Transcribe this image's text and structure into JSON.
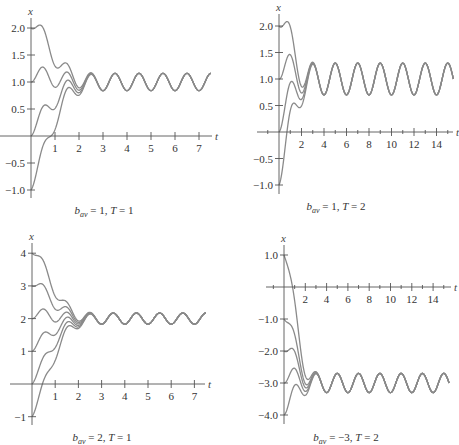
{
  "chart_data": [
    {
      "type": "line",
      "id": "p1",
      "caption": {
        "var": "b",
        "sub": "av",
        "rest": " = 1, ",
        "T": "T",
        "tail": " = 1"
      },
      "xlabel": "t",
      "ylabel": "x",
      "xlim": [
        0,
        7.5
      ],
      "ylim": [
        -1.0,
        2.0
      ],
      "xticks": [
        1,
        2,
        3,
        4,
        5,
        6,
        7
      ],
      "xtick_labels": [
        "1",
        "2",
        "3",
        "4",
        "5",
        "6",
        "7"
      ],
      "yticks": [
        2.0,
        1.5,
        1.0,
        0.5,
        -0.5,
        -1.0
      ],
      "ytick_labels": [
        "2.0",
        "1.5",
        "1.0",
        "0.5",
        "−0.5",
        "−1.0"
      ],
      "b_av": 1,
      "T": 1,
      "steady_center": 1.0,
      "steady_amplitude": 0.16,
      "initial_values": [
        2.0,
        1.0,
        0.0,
        -1.0
      ],
      "series": [
        {
          "name": "x(0)=2.0"
        },
        {
          "name": "x(0)=1.0"
        },
        {
          "name": "x(0)=0.0"
        },
        {
          "name": "x(0)=-1.0"
        }
      ]
    },
    {
      "type": "line",
      "id": "p2",
      "caption": {
        "var": "b",
        "sub": "av",
        "rest": " = 1, ",
        "T": "T",
        "tail": " = 2"
      },
      "xlabel": "t",
      "ylabel": "x",
      "xlim": [
        -1.5,
        15.5
      ],
      "ylim": [
        -1.0,
        2.0
      ],
      "xticks": [
        2,
        4,
        6,
        8,
        10,
        12,
        14
      ],
      "xtick_labels": [
        "2",
        "4",
        "6",
        "8",
        "10",
        "12",
        "14"
      ],
      "minor_xticks": [
        -1,
        1,
        3,
        5,
        7,
        9,
        11,
        13,
        15
      ],
      "yticks": [
        2.0,
        1.5,
        1.0,
        0.5,
        -0.5,
        -1.0
      ],
      "ytick_labels": [
        "2.0",
        "1.5",
        "1.0",
        "0.5",
        "−0.5",
        "−1.0"
      ],
      "b_av": 1,
      "T": 2,
      "steady_center": 1.0,
      "steady_amplitude": 0.3,
      "initial_values": [
        2.0,
        1.0,
        0.0,
        -1.0
      ],
      "series": [
        {
          "name": "x(0)=2.0"
        },
        {
          "name": "x(0)=1.0"
        },
        {
          "name": "x(0)=0.0"
        },
        {
          "name": "x(0)=-1.0"
        }
      ]
    },
    {
      "type": "line",
      "id": "p3",
      "caption": {
        "var": "b",
        "sub": "av",
        "rest": " = 2, ",
        "T": "T",
        "tail": " = 1"
      },
      "xlabel": "t",
      "ylabel": "x",
      "xlim": [
        -1.0,
        7.5
      ],
      "ylim": [
        -1.0,
        4.0
      ],
      "xticks": [
        1,
        2,
        3,
        4,
        5,
        6,
        7
      ],
      "xtick_labels": [
        "1",
        "2",
        "3",
        "4",
        "5",
        "6",
        "7"
      ],
      "yticks": [
        4,
        3,
        2,
        1,
        -1
      ],
      "ytick_labels": [
        "4",
        "3",
        "2",
        "1",
        "−1"
      ],
      "b_av": 2,
      "T": 1,
      "steady_center": 2.0,
      "steady_amplitude": 0.17,
      "initial_values": [
        4.0,
        3.0,
        2.0,
        1.0,
        0.0,
        -1.0
      ],
      "series": [
        {
          "name": "x(0)=4"
        },
        {
          "name": "x(0)=3"
        },
        {
          "name": "x(0)=2"
        },
        {
          "name": "x(0)=1"
        },
        {
          "name": "x(0)=0"
        },
        {
          "name": "x(0)=-1"
        }
      ]
    },
    {
      "type": "line",
      "id": "p4",
      "caption": {
        "var": "b",
        "sub": "av",
        "rest": " = −3, ",
        "T": "T",
        "tail": " = 2"
      },
      "xlabel": "t",
      "ylabel": "x",
      "xlim": [
        -1.5,
        15.5
      ],
      "ylim": [
        -4.0,
        1.0
      ],
      "xticks": [
        2,
        4,
        6,
        8,
        10,
        12,
        14
      ],
      "xtick_labels": [
        "2",
        "4",
        "6",
        "8",
        "10",
        "12",
        "14"
      ],
      "minor_xticks": [
        -1,
        1,
        3,
        5,
        7,
        9,
        11,
        13,
        15
      ],
      "yticks": [
        1.0,
        -1.0,
        -2.0,
        -3.0,
        -4.0
      ],
      "ytick_labels": [
        "1.0",
        "−1.0",
        "−2.0",
        "−3.0",
        "−4.0"
      ],
      "b_av": -3,
      "T": 2,
      "steady_center": -3.0,
      "steady_amplitude": 0.3,
      "initial_values": [
        1.0,
        -1.0,
        -2.0,
        -3.0,
        -4.0
      ],
      "series": [
        {
          "name": "x(0)=1.0"
        },
        {
          "name": "x(0)=-1.0"
        },
        {
          "name": "x(0)=-2.0"
        },
        {
          "name": "x(0)=-3.0"
        },
        {
          "name": "x(0)=-4.0"
        }
      ]
    }
  ]
}
